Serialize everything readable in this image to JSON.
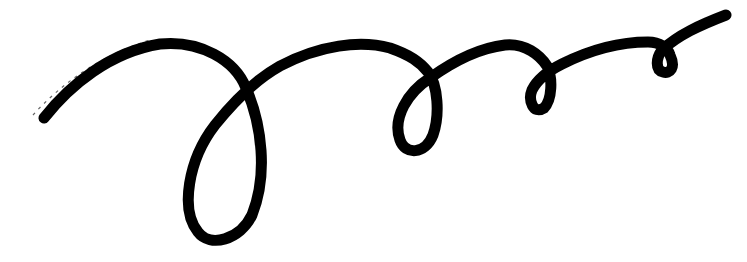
{
  "image": {
    "description": "Hand-drawn black ink swirl line with loops, on white background",
    "width": 747,
    "height": 262,
    "background_color": "#ffffff",
    "ink_color": "#000000",
    "loop_count": 4
  }
}
